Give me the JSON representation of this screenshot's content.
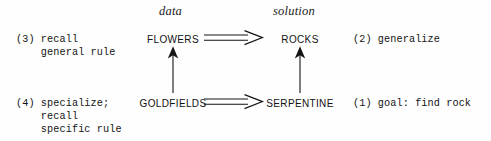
{
  "figure": {
    "background_color": "#fefefe",
    "ink_color": "#141414"
  },
  "columns": {
    "data_label": "data",
    "solution_label": "solution"
  },
  "nodes": {
    "top_left": "FLOWERS",
    "top_right": "ROCKS",
    "bottom_left": "GOLDFIELDS",
    "bottom_right": "SERPENTINE"
  },
  "annotations": {
    "step3": "(3) recall\n    general rule",
    "step4": "(4) specialize;\n    recall\n    specific rule",
    "step2": "(2) generalize",
    "step1": "(1) goal: find rock"
  },
  "arrows": {
    "horizontal_top": "double-line-arrow-right",
    "horizontal_bottom": "double-line-arrow-right",
    "vertical_left": "thin-arrow-up",
    "vertical_right": "thin-arrow-up"
  }
}
